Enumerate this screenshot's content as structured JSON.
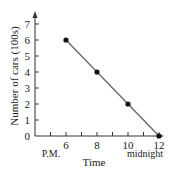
{
  "chart_data": {
    "type": "line",
    "title": "",
    "xlabel": "Time",
    "ylabel": "Number of cars (100s)",
    "x": [
      6,
      8,
      10,
      12
    ],
    "values": [
      6,
      4,
      2,
      0
    ],
    "series": [
      {
        "name": "Number of cars",
        "x": [
          6,
          8,
          10,
          12
        ],
        "values": [
          6,
          4,
          2,
          0
        ]
      }
    ],
    "x_ticks": [
      "6",
      "8",
      "10",
      "12"
    ],
    "x_tick_sublabels": {
      "6": "P.M.",
      "12": "midnight"
    },
    "y_ticks": [
      "0",
      "1",
      "2",
      "3",
      "4",
      "5",
      "6",
      "7"
    ],
    "xlim": [
      5,
      13
    ],
    "ylim": [
      0,
      7.5
    ],
    "grid": false,
    "legend": "none"
  },
  "labels": {
    "xlabel": "Time",
    "ylabel": "Number of cars (100s)",
    "pm": "P.M.",
    "midnight": "midnight"
  },
  "colors": {
    "axis": "#333333",
    "line": "#666666",
    "marker": "#111111"
  }
}
